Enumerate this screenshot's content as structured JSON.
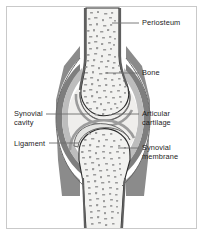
{
  "figure": {
    "background_color": "#ffffff",
    "frame_color": "#c9c9c9",
    "label_color": "#1d1d1d",
    "leader_color": "#6e6e6e"
  },
  "palette": {
    "bone_fill": "#f2f2f0",
    "bone_outline": "#2b2b2b",
    "trabecula": "#9a9a9a",
    "cartilage_fill": "#e4e4e2",
    "cartilage_outline": "#5a5a5a",
    "synovial_membrane": "#b9b9b9",
    "ligament": "#7e7e7e",
    "capsule_outer": "#6a6a6a",
    "cavity_fill": "#efeeec"
  },
  "labels": [
    {
      "id": "periosteum",
      "text": "Periosteum",
      "side": "right",
      "x": 142,
      "y": 19,
      "leader": {
        "x1": 112,
        "y1": 23,
        "x2": 139,
        "y2": 23
      }
    },
    {
      "id": "bone",
      "text": "Bone",
      "side": "right",
      "x": 142,
      "y": 69,
      "leader": {
        "x1": 105,
        "y1": 73,
        "x2": 139,
        "y2": 73
      }
    },
    {
      "id": "articular-cartilage",
      "text": "Articular\ncartilage",
      "side": "right",
      "x": 142,
      "y": 110,
      "leader": {
        "x1": 112,
        "y1": 114,
        "x2": 139,
        "y2": 114
      }
    },
    {
      "id": "synovial-membrane",
      "text": "Synovial\nmembrane",
      "side": "right",
      "x": 142,
      "y": 144,
      "leader": {
        "x1": 118,
        "y1": 148,
        "x2": 139,
        "y2": 148
      }
    },
    {
      "id": "synovial-cavity",
      "text": "Synovial\ncavity",
      "side": "left",
      "x": 14,
      "y": 110,
      "leader": {
        "x1": 46,
        "y1": 114,
        "x2": 90,
        "y2": 114
      }
    },
    {
      "id": "ligament",
      "text": "Ligament",
      "side": "left",
      "x": 14,
      "y": 140,
      "leader": {
        "x1": 49,
        "y1": 143,
        "x2": 79,
        "y2": 143
      }
    }
  ],
  "structures": [
    {
      "id": "upper-bone",
      "name": "Upper long bone (diaphysis and epiphysis)"
    },
    {
      "id": "lower-bone",
      "name": "Lower long bone (epiphysis and diaphysis)"
    },
    {
      "id": "upper-cartilage",
      "name": "Articular cartilage cap on upper bone"
    },
    {
      "id": "lower-cartilage",
      "name": "Articular cartilage cap on lower bone"
    },
    {
      "id": "joint-cavity",
      "name": "Synovial cavity filled with synovial fluid"
    },
    {
      "id": "synovial-membrane-layer",
      "name": "Synovial membrane lining the capsule"
    },
    {
      "id": "ligament-layer",
      "name": "Ligament / fibrous joint capsule"
    },
    {
      "id": "periosteum-layer",
      "name": "Periosteum covering bone shaft"
    }
  ]
}
